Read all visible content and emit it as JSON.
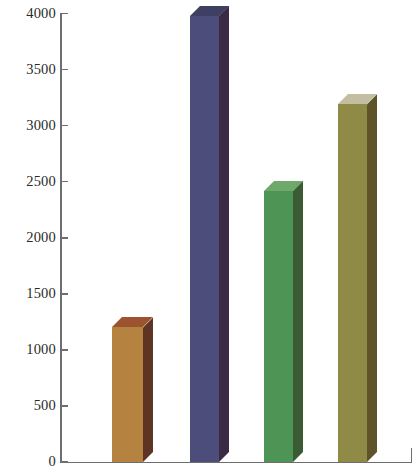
{
  "chart_data": {
    "type": "bar",
    "title": "",
    "subtitle": "",
    "xlabel": "",
    "ylabel": "",
    "categories": [
      "",
      "",
      "",
      ""
    ],
    "values": [
      1200,
      3980,
      2420,
      3190
    ],
    "ylim": [
      0,
      4000
    ],
    "yticks": [
      0,
      500,
      1000,
      1500,
      2000,
      2500,
      3000,
      3500,
      4000
    ],
    "ytick_labels": [
      "0",
      "500",
      "1000",
      "1500",
      "2000",
      "2500",
      "3000",
      "3500",
      "4000"
    ],
    "xtick_labels": [],
    "grid": false,
    "legend": false,
    "legend_position": "none",
    "style": "3d-isometric",
    "series": [
      {
        "name": "series-1",
        "values": [
          1200,
          3980,
          2420,
          3190
        ]
      }
    ],
    "bars": [
      {
        "index": 1,
        "label": "",
        "value": 1200,
        "color_front": "#B5833F",
        "color_side": "#5E3424",
        "color_top": "#9C5430"
      },
      {
        "index": 2,
        "label": "",
        "value": 3980,
        "color_front": "#4C4D7A",
        "color_side": "#3A2A44",
        "color_top": "#3F3F63"
      },
      {
        "index": 3,
        "label": "",
        "value": 2420,
        "color_front": "#4E9455",
        "color_side": "#3A5B34",
        "color_top": "#6FA86B"
      },
      {
        "index": 4,
        "label": "",
        "value": 3190,
        "color_front": "#8F8A46",
        "color_side": "#5E5329",
        "color_top": "#C3BDA2"
      }
    ],
    "axis_color": "#6E6E6E",
    "background_color": "#FFFFFF"
  }
}
